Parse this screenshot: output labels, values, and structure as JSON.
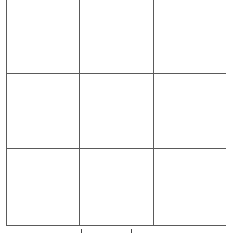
{
  "grid": {
    "rows": 3,
    "columns": 3,
    "line_color": "#5a5a5a",
    "background_color": "#ffffff",
    "vertical_lines_x": [
      6,
      79,
      153
    ],
    "horizontal_lines_y": [
      73,
      148,
      225
    ],
    "cells": [
      {
        "row": 0,
        "col": 0,
        "label": ""
      },
      {
        "row": 0,
        "col": 1,
        "label": ""
      },
      {
        "row": 0,
        "col": 2,
        "label": ""
      },
      {
        "row": 1,
        "col": 0,
        "label": ""
      },
      {
        "row": 1,
        "col": 1,
        "label": ""
      },
      {
        "row": 1,
        "col": 2,
        "label": ""
      },
      {
        "row": 2,
        "col": 0,
        "label": ""
      },
      {
        "row": 2,
        "col": 1,
        "label": ""
      },
      {
        "row": 2,
        "col": 2,
        "label": ""
      }
    ]
  },
  "ticks": {
    "color": "#444444",
    "x": [
      81,
      131
    ]
  }
}
